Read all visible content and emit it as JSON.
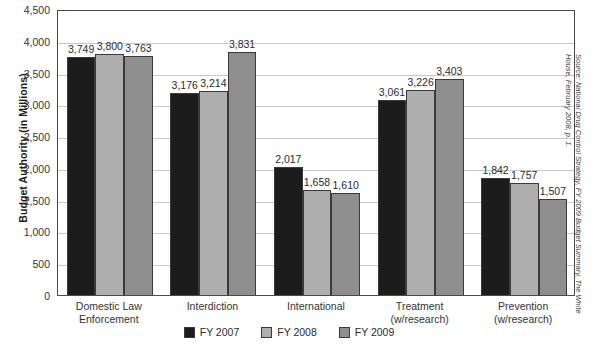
{
  "chart_data": {
    "type": "bar",
    "title": "",
    "xlabel": "",
    "ylabel": "Budget Authority (in Millions)",
    "ylim": [
      0,
      4500
    ],
    "ytick_step": 500,
    "grid": true,
    "legend_position": "bottom",
    "categories": [
      "Domestic Law Enforcement",
      "Interdiction",
      "International",
      "Treatment (w/research)",
      "Prevention (w/research)"
    ],
    "category_lines": [
      [
        "Domestic Law",
        "Enforcement"
      ],
      [
        "Interdiction",
        ""
      ],
      [
        "International",
        ""
      ],
      [
        "Treatment",
        "(w/research)"
      ],
      [
        "Prevention",
        "(w/research)"
      ]
    ],
    "ytick_labels": [
      "4,500",
      "4,000",
      "3,500",
      "3,000",
      "2,500",
      "2,000",
      "1,500",
      "1,000",
      "500",
      "0"
    ],
    "ytick_values": [
      4500,
      4000,
      3500,
      3000,
      2500,
      2000,
      1500,
      1000,
      500,
      0
    ],
    "series": [
      {
        "name": "FY 2007",
        "color": "#1c1c1c",
        "values": [
          3749,
          3176,
          2017,
          3061,
          1842
        ],
        "labels": [
          "3,749",
          "3,176",
          "2,017",
          "3,061",
          "1,842"
        ]
      },
      {
        "name": "FY 2008",
        "color": "#aeaeae",
        "values": [
          3800,
          3214,
          1658,
          3226,
          1757
        ],
        "labels": [
          "3,800",
          "3,214",
          "1,658",
          "3,226",
          "1,757"
        ]
      },
      {
        "name": "FY 2009",
        "color": "#8e8e8e",
        "values": [
          3763,
          3831,
          1610,
          3403,
          1507
        ],
        "labels": [
          "3,763",
          "3,831",
          "1,610",
          "3,403",
          "1,507"
        ]
      }
    ]
  },
  "source_note": {
    "line1": "Source: National Drug Control Strategy, FY 2009 Budget Summary, The White",
    "line2": "House, February 2008, p. 1."
  }
}
